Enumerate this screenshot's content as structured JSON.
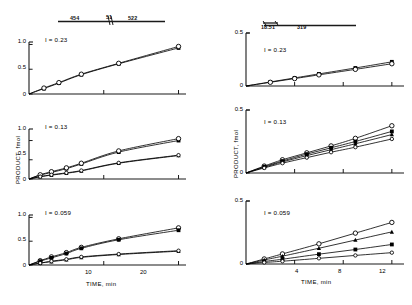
{
  "figure": {
    "axis_color": "#1a1a1a",
    "marker_color": "#000000",
    "background": "#ffffff"
  },
  "left_column": {
    "header": {
      "name": "wavelength-scale-bar",
      "labels": [
        "454",
        "51",
        "522"
      ]
    },
    "y_axis_label": "PRODUCT, fmol",
    "x_axis_label": "TIME, min"
  },
  "right_column": {
    "header": {
      "name": "wavelength-scale-bar",
      "labels": [
        "18.51",
        "319"
      ]
    },
    "y_axis_label": "PRODUCT, fmol",
    "x_axis_label": "TIME, min"
  },
  "chart_data": [
    {
      "id": "left-top",
      "type": "line",
      "title": "I = 0.23",
      "xlabel": "",
      "ylabel": "",
      "xlim": [
        0,
        21
      ],
      "ylim": [
        0,
        1.05
      ],
      "xticks": [
        0,
        10,
        20
      ],
      "xtick_labels": [
        "",
        "10",
        ""
      ],
      "yticks": [
        0,
        0.5,
        1.0
      ],
      "ytick_labels": [
        "0",
        "0.5",
        "1.0"
      ],
      "grid": false,
      "legend": "none",
      "series": [
        {
          "name": "series-1",
          "marker": "filled-square",
          "x": [
            0,
            2,
            4,
            7,
            12,
            20
          ],
          "y": [
            0.0,
            0.11,
            0.22,
            0.39,
            0.61,
            0.93
          ]
        },
        {
          "name": "series-2",
          "marker": "open-circle",
          "x": [
            0,
            2,
            4,
            7,
            12,
            20
          ],
          "y": [
            0.0,
            0.12,
            0.23,
            0.4,
            0.62,
            0.96
          ]
        }
      ]
    },
    {
      "id": "left-middle",
      "type": "line",
      "title": "I = 0.13",
      "xlabel": "",
      "ylabel": "PRODUCT, fmol",
      "xlim": [
        0,
        21
      ],
      "ylim": [
        0,
        1.3
      ],
      "xticks": [
        0,
        10,
        20
      ],
      "xtick_labels": [
        "",
        "",
        ""
      ],
      "yticks": [
        0,
        0.5,
        1.0
      ],
      "ytick_labels": [
        "0",
        "0.5",
        "1.0"
      ],
      "grid": false,
      "legend": "none",
      "series": [
        {
          "name": "series-1",
          "marker": "filled-square",
          "x": [
            0,
            1.5,
            3,
            5,
            7,
            12,
            20
          ],
          "y": [
            0.0,
            0.1,
            0.17,
            0.27,
            0.39,
            0.7,
            1.0
          ]
        },
        {
          "name": "series-2",
          "marker": "open-circle",
          "x": [
            0,
            1.5,
            3,
            5,
            7,
            12,
            20
          ],
          "y": [
            0.0,
            0.11,
            0.19,
            0.29,
            0.41,
            0.73,
            1.05
          ]
        },
        {
          "name": "series-3",
          "marker": "filled-triangle",
          "x": [
            0,
            1.5,
            3,
            5,
            7,
            12,
            20
          ],
          "y": [
            0.0,
            0.06,
            0.1,
            0.15,
            0.21,
            0.41,
            0.61
          ]
        },
        {
          "name": "series-4",
          "marker": "open-circle-small",
          "x": [
            0,
            1.5,
            3,
            5,
            7,
            12,
            20
          ],
          "y": [
            0.0,
            0.06,
            0.11,
            0.16,
            0.22,
            0.42,
            0.62
          ]
        }
      ]
    },
    {
      "id": "left-bottom",
      "type": "line",
      "title": "I = 0.059",
      "xlabel": "TIME, min",
      "ylabel": "",
      "xlim": [
        0,
        21
      ],
      "ylim": [
        0,
        1.05
      ],
      "xticks": [
        0,
        10,
        20
      ],
      "xtick_labels": [
        "0",
        "10",
        "20"
      ],
      "yticks": [
        0,
        0.5,
        1.0
      ],
      "ytick_labels": [
        "0",
        "0.5",
        "1.0"
      ],
      "grid": false,
      "legend": "none",
      "series": [
        {
          "name": "series-1",
          "marker": "open-circle",
          "x": [
            0,
            1.5,
            3,
            5,
            7,
            12,
            20
          ],
          "y": [
            0.0,
            0.09,
            0.17,
            0.26,
            0.37,
            0.55,
            0.78
          ]
        },
        {
          "name": "series-2",
          "marker": "filled-square",
          "x": [
            0,
            1.5,
            3,
            5,
            7,
            12,
            20
          ],
          "y": [
            0.0,
            0.08,
            0.15,
            0.24,
            0.35,
            0.53,
            0.73
          ]
        },
        {
          "name": "series-3",
          "marker": "filled-triangle",
          "x": [
            0,
            1.5,
            3,
            5,
            7,
            12,
            20
          ],
          "y": [
            0.0,
            0.04,
            0.07,
            0.11,
            0.16,
            0.22,
            0.29
          ]
        },
        {
          "name": "series-4",
          "marker": "open-circle-small",
          "x": [
            0,
            1.5,
            3,
            5,
            7,
            12,
            20
          ],
          "y": [
            0.0,
            0.04,
            0.08,
            0.12,
            0.17,
            0.23,
            0.3
          ]
        }
      ]
    },
    {
      "id": "right-top",
      "type": "line",
      "title": "I = 0.23",
      "xlabel": "",
      "ylabel": "",
      "xlim": [
        0,
        13
      ],
      "ylim": [
        0,
        0.5
      ],
      "xticks": [
        0,
        4,
        8,
        12
      ],
      "xtick_labels": [
        "0",
        "",
        "",
        ""
      ],
      "yticks": [
        0,
        0.5
      ],
      "ytick_labels": [
        "0",
        "0.5"
      ],
      "grid": false,
      "legend": "none",
      "series": [
        {
          "name": "series-1",
          "marker": "filled-square",
          "x": [
            0,
            2,
            4,
            6,
            9,
            12
          ],
          "y": [
            0.0,
            0.038,
            0.076,
            0.114,
            0.17,
            0.228
          ]
        },
        {
          "name": "series-2",
          "marker": "open-circle",
          "x": [
            0,
            2,
            4,
            6,
            9,
            12
          ],
          "y": [
            0.0,
            0.035,
            0.07,
            0.105,
            0.157,
            0.21
          ]
        }
      ]
    },
    {
      "id": "right-middle",
      "type": "line",
      "title": "I = 0.13",
      "xlabel": "",
      "ylabel": "PRODUCT, fmol",
      "xlim": [
        0,
        13
      ],
      "ylim": [
        0,
        0.5
      ],
      "xticks": [
        0,
        4,
        8,
        12
      ],
      "xtick_labels": [
        "0",
        "",
        "",
        ""
      ],
      "yticks": [
        0,
        0.5
      ],
      "ytick_labels": [
        "0",
        "0.5"
      ],
      "grid": false,
      "legend": "none",
      "series": [
        {
          "name": "series-1",
          "marker": "open-circle",
          "x": [
            0,
            1.5,
            3,
            5,
            7,
            9,
            12
          ],
          "y": [
            0.0,
            0.055,
            0.105,
            0.16,
            0.215,
            0.275,
            0.375
          ]
        },
        {
          "name": "series-2",
          "marker": "filled-square",
          "x": [
            0,
            1.5,
            3,
            5,
            7,
            9,
            12
          ],
          "y": [
            0.0,
            0.05,
            0.095,
            0.15,
            0.2,
            0.25,
            0.33
          ]
        },
        {
          "name": "series-3",
          "marker": "filled-triangle",
          "x": [
            0,
            1.5,
            3,
            5,
            7,
            9,
            12
          ],
          "y": [
            0.0,
            0.045,
            0.088,
            0.138,
            0.185,
            0.232,
            0.305
          ]
        },
        {
          "name": "series-4",
          "marker": "open-circle-small",
          "x": [
            0,
            1.5,
            3,
            5,
            7,
            9,
            12
          ],
          "y": [
            0.0,
            0.04,
            0.078,
            0.122,
            0.165,
            0.205,
            0.27
          ]
        }
      ]
    },
    {
      "id": "right-bottom",
      "type": "line",
      "title": "I = 0.059",
      "xlabel": "TIME, min",
      "ylabel": "",
      "xlim": [
        0,
        13
      ],
      "ylim": [
        0,
        0.5
      ],
      "xticks": [
        0,
        4,
        8,
        12
      ],
      "xtick_labels": [
        "0",
        "4",
        "8",
        "12"
      ],
      "yticks": [
        0,
        0.5
      ],
      "ytick_labels": [
        "0",
        "0.5"
      ],
      "grid": false,
      "legend": "none",
      "series": [
        {
          "name": "series-1",
          "marker": "open-circle",
          "x": [
            0,
            1.5,
            3,
            6,
            9,
            12
          ],
          "y": [
            0.0,
            0.04,
            0.08,
            0.16,
            0.245,
            0.33
          ]
        },
        {
          "name": "series-2",
          "marker": "filled-triangle",
          "x": [
            0,
            1.5,
            3,
            6,
            9,
            12
          ],
          "y": [
            0.0,
            0.032,
            0.062,
            0.125,
            0.19,
            0.255
          ]
        },
        {
          "name": "series-3",
          "marker": "filled-square",
          "x": [
            0,
            1.5,
            3,
            6,
            9,
            12
          ],
          "y": [
            0.0,
            0.02,
            0.038,
            0.078,
            0.115,
            0.155
          ]
        },
        {
          "name": "series-4",
          "marker": "open-circle-small",
          "x": [
            0,
            1.5,
            3,
            6,
            9,
            12
          ],
          "y": [
            0.0,
            0.012,
            0.022,
            0.045,
            0.068,
            0.09
          ]
        }
      ]
    }
  ]
}
